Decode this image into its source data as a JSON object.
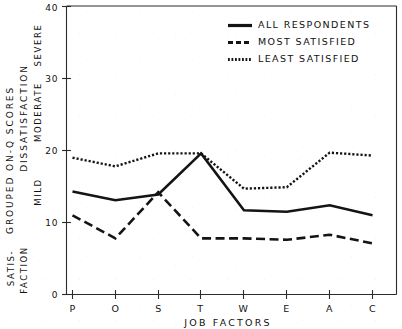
{
  "chart_data": {
    "type": "line",
    "title": "",
    "xlabel": "JOB FACTORS",
    "ylabel": "GROUPED ON-Q SCORES",
    "ylim": [
      0,
      40
    ],
    "yticks": [
      0,
      10,
      20,
      30,
      40
    ],
    "grid": false,
    "legend_position": "top-right",
    "categories": [
      "P",
      "O",
      "S",
      "T",
      "W",
      "E",
      "A",
      "C"
    ],
    "series": [
      {
        "name": "ALL RESPONDENTS",
        "style": "solid",
        "values": [
          14.3,
          13.1,
          13.9,
          19.6,
          11.7,
          11.5,
          12.4,
          11.0
        ]
      },
      {
        "name": "MOST SATISFIED",
        "style": "dashed",
        "values": [
          11.0,
          7.8,
          14.2,
          7.8,
          7.8,
          7.6,
          8.3,
          7.1
        ]
      },
      {
        "name": "LEAST SATISFIED",
        "style": "dotted",
        "values": [
          19.0,
          17.8,
          19.6,
          19.6,
          14.7,
          14.9,
          19.7,
          19.3
        ]
      }
    ],
    "y_zone_labels": [
      "SEVERE",
      "MODERATE",
      "MILD"
    ],
    "y_axis_secondary_label": "DISSATISFACTION",
    "y_axis_bottom_label_line1": "SATIS-",
    "y_axis_bottom_label_line2": "FACTION",
    "axis_color": "#2b2b2b",
    "line_color": "#141414"
  },
  "ticks": {
    "y": [
      "0",
      "10",
      "20",
      "30",
      "40"
    ]
  },
  "legend": {
    "items": [
      {
        "label": "ALL RESPONDENTS"
      },
      {
        "label": "MOST SATISFIED"
      },
      {
        "label": "LEAST SATISFIED"
      }
    ]
  },
  "axes": {
    "x_title": "JOB FACTORS",
    "y_title": "GROUPED ON-Q SCORES",
    "y_subtitle": "DISSATISFACTION",
    "zone_severe": "SEVERE",
    "zone_moderate": "MODERATE",
    "zone_mild": "MILD",
    "zone_satis_1": "SATIS-",
    "zone_satis_2": "FACTION"
  },
  "categories": {
    "c0": "P",
    "c1": "O",
    "c2": "S",
    "c3": "T",
    "c4": "W",
    "c5": "E",
    "c6": "A",
    "c7": "C"
  }
}
